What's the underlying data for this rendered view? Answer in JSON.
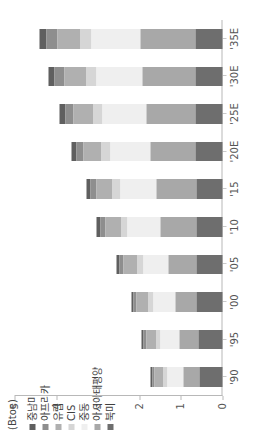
{
  "unit_label": "(Btoe)",
  "legend": {
    "items": [
      {
        "label": "중남미",
        "color": "#5f5f5f"
      },
      {
        "label": "아프리카",
        "color": "#8e8e8e"
      },
      {
        "label": "유럽",
        "color": "#b0b0b0"
      },
      {
        "label": "CIS",
        "color": "#d6d6d6"
      },
      {
        "label": "중동",
        "color": "#efefef"
      },
      {
        "label": "아시아태평양",
        "color": "#a8a8a8"
      },
      {
        "label": "북미",
        "color": "#6e6e6e"
      }
    ]
  },
  "chart_data": {
    "type": "bar",
    "title": "",
    "subtitle": "",
    "xlabel": "",
    "ylabel": "(Btoe)",
    "ylim": [
      0,
      5
    ],
    "yticks": [
      0,
      1,
      2,
      3,
      4,
      5
    ],
    "ytick_labels": [
      "0",
      "1",
      "2",
      "3",
      "4",
      "5"
    ],
    "grid": false,
    "stacked": true,
    "legend_position": "top-left",
    "categories": [
      "'90",
      "'95",
      "'00",
      "'05",
      "'10",
      "'15",
      "'20E",
      "'25E",
      "'30E",
      "'35E"
    ],
    "series": [
      {
        "name": "북미",
        "color": "#6e6e6e",
        "values": [
          0.55,
          0.58,
          0.62,
          0.63,
          0.62,
          0.62,
          0.64,
          0.65,
          0.66,
          0.66
        ]
      },
      {
        "name": "아시아태평양",
        "color": "#a8a8a8",
        "values": [
          0.38,
          0.45,
          0.52,
          0.66,
          0.86,
          0.96,
          1.08,
          1.18,
          1.26,
          1.32
        ]
      },
      {
        "name": "중동",
        "color": "#efefef",
        "values": [
          0.4,
          0.46,
          0.52,
          0.62,
          0.8,
          0.88,
          0.98,
          1.05,
          1.12,
          1.18
        ]
      },
      {
        "name": "CIS",
        "color": "#d6d6d6",
        "values": [
          0.08,
          0.1,
          0.12,
          0.14,
          0.16,
          0.18,
          0.2,
          0.22,
          0.24,
          0.26
        ]
      },
      {
        "name": "유럽",
        "color": "#b0b0b0",
        "values": [
          0.22,
          0.24,
          0.28,
          0.33,
          0.38,
          0.4,
          0.45,
          0.48,
          0.52,
          0.55
        ]
      },
      {
        "name": "아프리카",
        "color": "#8e8e8e",
        "values": [
          0.06,
          0.07,
          0.08,
          0.1,
          0.12,
          0.14,
          0.17,
          0.2,
          0.23,
          0.26
        ]
      },
      {
        "name": "중남미",
        "color": "#5f5f5f",
        "values": [
          0.04,
          0.05,
          0.06,
          0.07,
          0.08,
          0.09,
          0.11,
          0.13,
          0.15,
          0.17
        ]
      }
    ],
    "totals": [
      1.73,
      1.95,
      2.2,
      2.55,
      3.02,
      3.27,
      3.63,
      3.91,
      4.18,
      4.4
    ]
  }
}
